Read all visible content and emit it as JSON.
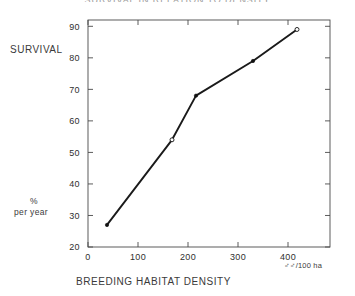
{
  "figure": {
    "title": "SURVIVAL IN RELATION TO DENSITY",
    "y_caption": "SURVIVAL",
    "y_unit_line1": "%",
    "y_unit_line2": "per year",
    "x_title": "BREEDING  HABITAT  DENSITY",
    "x_unit": "♂♂/100 ha"
  },
  "chart_data": {
    "type": "line",
    "title": "SURVIVAL IN RELATION TO DENSITY",
    "xlabel": "BREEDING HABITAT DENSITY",
    "ylabel": "SURVIVAL",
    "x_unit": "♂♂/100 ha",
    "y_unit": "% per year",
    "xlim": [
      0,
      484
    ],
    "ylim": [
      20,
      92
    ],
    "grid": false,
    "legend": null,
    "xticks": [
      0,
      100,
      200,
      300,
      400
    ],
    "xtick_labels": [
      "0",
      "100",
      "200",
      "300",
      "400"
    ],
    "yticks": [
      20,
      30,
      40,
      50,
      60,
      70,
      80,
      90
    ],
    "ytick_labels": [
      "20",
      "30",
      "40",
      "50",
      "60",
      "70",
      "80",
      "90"
    ],
    "x": [
      38,
      168,
      216,
      330,
      418
    ],
    "y": [
      27,
      54,
      68,
      79,
      89
    ],
    "marker_styles": [
      "filled",
      "open",
      "filled",
      "filled",
      "open"
    ],
    "series": [
      {
        "name": "survival",
        "points": [
          {
            "x": 38,
            "y": 27
          },
          {
            "x": 168,
            "y": 54
          },
          {
            "x": 216,
            "y": 68
          },
          {
            "x": 330,
            "y": 79
          },
          {
            "x": 418,
            "y": 89
          }
        ]
      }
    ]
  }
}
